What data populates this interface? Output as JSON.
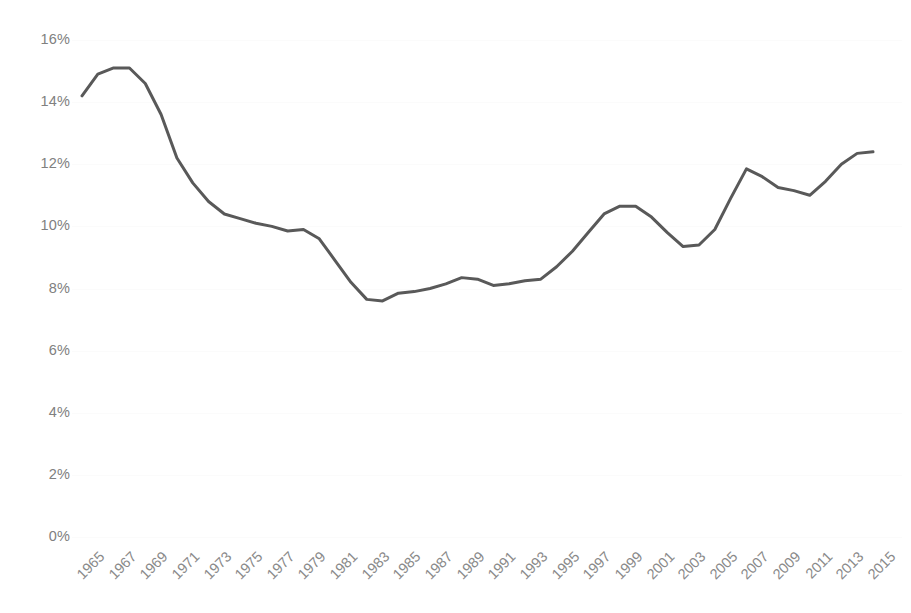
{
  "chart_data": {
    "type": "line",
    "title": "",
    "subtitle": "",
    "xlabel": "",
    "ylabel": "",
    "legend": [],
    "legend_position": "none",
    "grid": true,
    "xlim": [
      1965,
      2015
    ],
    "ylim": [
      0,
      16
    ],
    "y_tick_labels": [
      "16%",
      "14%",
      "12%",
      "10%",
      "8%",
      "6%",
      "4%",
      "2%",
      "0%"
    ],
    "y_tick_values": [
      16,
      14,
      12,
      10,
      8,
      6,
      4,
      2,
      0
    ],
    "x_tick_labels": [
      "1965",
      "1967",
      "1969",
      "1971",
      "1973",
      "1975",
      "1977",
      "1979",
      "1981",
      "1983",
      "1985",
      "1987",
      "1989",
      "1991",
      "1993",
      "1995",
      "1997",
      "1999",
      "2001",
      "2003",
      "2005",
      "2007",
      "2009",
      "2011",
      "2013",
      "2015"
    ],
    "x_tick_values": [
      1965,
      1967,
      1969,
      1971,
      1973,
      1975,
      1977,
      1979,
      1981,
      1983,
      1985,
      1987,
      1989,
      1991,
      1993,
      1995,
      1997,
      1999,
      2001,
      2003,
      2005,
      2007,
      2009,
      2011,
      2013,
      2015
    ],
    "series": [
      {
        "name": "share",
        "color": "#595959",
        "line_width": 3,
        "x": [
          1965,
          1966,
          1967,
          1968,
          1969,
          1970,
          1971,
          1972,
          1973,
          1974,
          1975,
          1976,
          1977,
          1978,
          1979,
          1980,
          1981,
          1982,
          1983,
          1984,
          1985,
          1986,
          1987,
          1988,
          1989,
          1990,
          1991,
          1992,
          1993,
          1994,
          1995,
          1996,
          1997,
          1998,
          1999,
          2000,
          2001,
          2002,
          2003,
          2004,
          2005,
          2006,
          2007,
          2008,
          2009,
          2010,
          2011,
          2012,
          2013,
          2014,
          2015
        ],
        "values": [
          14.2,
          14.9,
          15.1,
          15.1,
          14.6,
          13.6,
          12.2,
          11.4,
          10.8,
          10.4,
          10.25,
          10.1,
          10.0,
          9.85,
          9.9,
          9.6,
          8.9,
          8.2,
          7.65,
          7.6,
          7.85,
          7.9,
          8.0,
          8.15,
          8.35,
          8.3,
          8.1,
          8.15,
          8.25,
          8.3,
          8.7,
          9.2,
          9.8,
          10.4,
          10.65,
          10.65,
          10.3,
          9.8,
          9.35,
          9.4,
          9.9,
          10.9,
          11.85,
          11.6,
          11.25,
          11.15,
          11.0,
          11.45,
          12.0,
          12.35,
          12.4
        ]
      }
    ]
  },
  "axis": {
    "y_label_color": "#808080",
    "x_label_color": "#8a8a8a",
    "gridline_color": "#fbfbfb"
  }
}
